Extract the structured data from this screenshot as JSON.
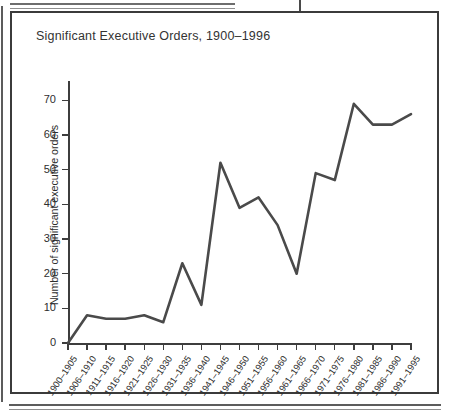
{
  "figure": {
    "title": "Significant Executive Orders, 1900–1996"
  },
  "chart_data": {
    "type": "line",
    "title": "Significant Executive Orders, 1900–1996",
    "xlabel": "",
    "ylabel": "Number of significant executive orders",
    "categories": [
      "1900–1905",
      "1906–1910",
      "1911–1915",
      "1916–1920",
      "1921–1925",
      "1926–1930",
      "1931–1935",
      "1936–1940",
      "1941–1945",
      "1946–1950",
      "1951–1955",
      "1956–1960",
      "1961–1965",
      "1966–1970",
      "1971–1975",
      "1976–1980",
      "1981–1985",
      "1986–1990",
      "1991–1995"
    ],
    "values": [
      0,
      8,
      7,
      7,
      8,
      6,
      23,
      11,
      52,
      39,
      42,
      34,
      20,
      49,
      47,
      69,
      63,
      63,
      66
    ],
    "ylim": [
      0,
      75
    ],
    "yticks": [
      0,
      10,
      20,
      30,
      40,
      50,
      60,
      70
    ],
    "ytick_labels": [
      "0",
      "10",
      "20",
      "30",
      "40",
      "50",
      "60",
      "70"
    ],
    "grid": false,
    "legend": false,
    "series_color": "#4a4a4a",
    "axis_color": "#3d3d3d"
  }
}
